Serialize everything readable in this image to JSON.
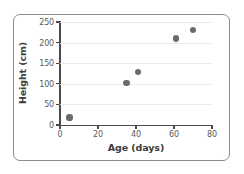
{
  "chart_data": {
    "type": "scatter",
    "title": "",
    "xlabel": "Age (days)",
    "ylabel": "Height (cm)",
    "xlim": [
      0,
      80
    ],
    "ylim": [
      0,
      250
    ],
    "xticks": [
      0,
      20,
      40,
      60,
      80
    ],
    "yticks": [
      0,
      50,
      100,
      150,
      200,
      250
    ],
    "xtick_labels": [
      "0",
      "20",
      "40",
      "60",
      "80"
    ],
    "ytick_labels": [
      "0",
      "50",
      "100",
      "150",
      "200",
      "250"
    ],
    "grid": "horizontal",
    "legend": "none",
    "series": [
      {
        "name": "height-vs-age",
        "marker": "circle",
        "color": "#6b6b6b",
        "points": [
          {
            "x": 5,
            "y": 18
          },
          {
            "x": 35,
            "y": 101
          },
          {
            "x": 41,
            "y": 128
          },
          {
            "x": 61,
            "y": 210
          },
          {
            "x": 70,
            "y": 231
          }
        ]
      }
    ]
  },
  "style": {
    "frame_color": "#8c8c8c",
    "axis_color": "#4a4a4a",
    "grid_color": "#ececec",
    "tick_text_color": "#5a5a5a",
    "axis_label_color": "#3d3d3d",
    "background": "#ffffff"
  }
}
